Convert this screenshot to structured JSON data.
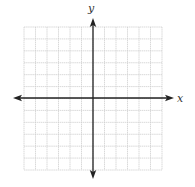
{
  "diagram": {
    "type": "coordinate-plane",
    "grid": {
      "columns": 12,
      "rows": 12,
      "left": 24,
      "top": 27,
      "right": 162,
      "bottom": 170,
      "line_color": "#cfcfcf"
    },
    "axes": {
      "color": "#222222",
      "origin_px": {
        "x": 93,
        "y": 98
      },
      "x_axis": {
        "label": "x",
        "from_px": 13,
        "to_px": 174
      },
      "y_axis": {
        "label": "y",
        "from_px": 18,
        "to_px": 179
      }
    }
  }
}
